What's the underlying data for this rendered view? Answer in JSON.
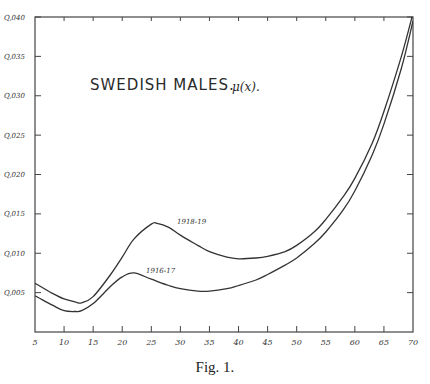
{
  "chart_data": {
    "type": "line",
    "title": "SWEDISH MALES.",
    "title_symbol": "μ(x).",
    "xlabel": "",
    "ylabel": "",
    "xlim": [
      5,
      70
    ],
    "ylim": [
      0,
      0.04
    ],
    "x_ticks": [
      "5",
      "10",
      "15",
      "20",
      "25",
      "30",
      "35",
      "40",
      "45",
      "50",
      "55",
      "60",
      "65",
      "70"
    ],
    "y_ticks": [
      "Q,005",
      "Q,010",
      "Q,015",
      "Q,020",
      "Q,025",
      "Q,030",
      "Q,035",
      "Q,040"
    ],
    "grid": false,
    "caption": "Fig. 1.",
    "series": [
      {
        "name": "1918-19",
        "x": [
          5,
          8,
          10,
          12,
          13,
          15,
          18,
          20,
          22,
          25,
          26,
          28,
          30,
          33,
          35,
          38,
          40,
          43,
          45,
          48,
          50,
          53,
          55,
          58,
          60,
          63,
          65,
          68,
          70
        ],
        "values": [
          0.0062,
          0.0049,
          0.0042,
          0.0038,
          0.0037,
          0.0045,
          0.0073,
          0.0095,
          0.0118,
          0.0137,
          0.0138,
          0.0133,
          0.0123,
          0.011,
          0.0102,
          0.0095,
          0.0093,
          0.0094,
          0.0096,
          0.0102,
          0.011,
          0.0127,
          0.0143,
          0.0172,
          0.0195,
          0.024,
          0.028,
          0.035,
          0.0405
        ]
      },
      {
        "name": "1916-17",
        "x": [
          5,
          8,
          10,
          12,
          13,
          15,
          18,
          20,
          22,
          25,
          28,
          30,
          33,
          35,
          38,
          40,
          43,
          45,
          48,
          50,
          53,
          55,
          58,
          60,
          63,
          65,
          68,
          70
        ],
        "values": [
          0.0046,
          0.0034,
          0.0027,
          0.0026,
          0.0027,
          0.0036,
          0.0058,
          0.007,
          0.0075,
          0.0067,
          0.0059,
          0.0055,
          0.0052,
          0.0052,
          0.0055,
          0.0059,
          0.0066,
          0.0073,
          0.0085,
          0.0094,
          0.0112,
          0.0127,
          0.0155,
          0.0179,
          0.0225,
          0.0264,
          0.0335,
          0.0395
        ]
      }
    ],
    "annotations": [
      {
        "text": "1918-19",
        "x": 28,
        "y": 0.0143
      },
      {
        "text": "1916-17",
        "x": 24,
        "y": 0.0079
      }
    ]
  },
  "labels": {
    "title": "SWEDISH MALES.",
    "symbol": "μ(x).",
    "series_upper": "1918-19",
    "series_lower": "1916-17",
    "caption": "Fig. 1."
  }
}
